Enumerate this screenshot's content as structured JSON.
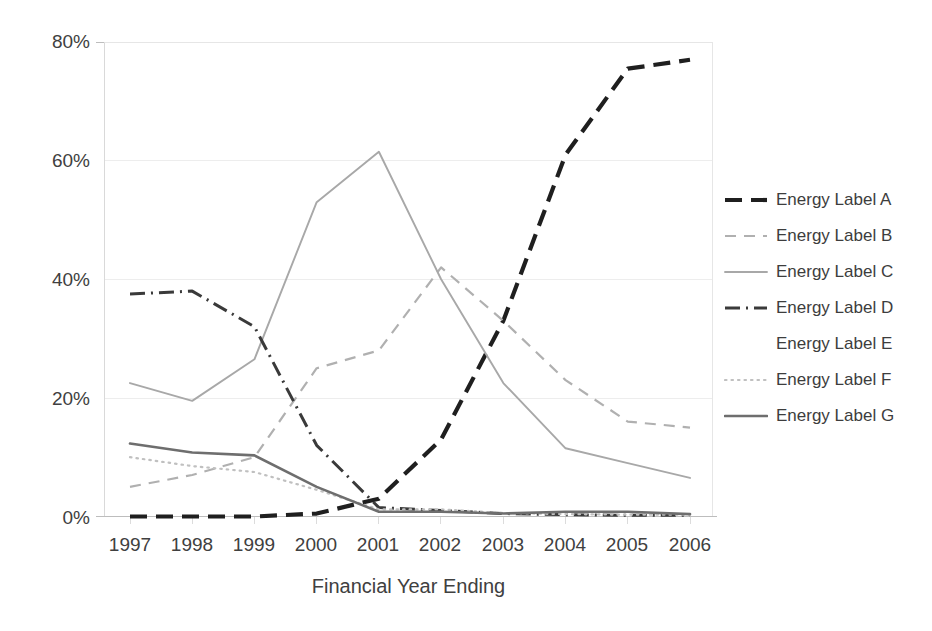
{
  "chart_data": {
    "type": "line",
    "title": "",
    "xlabel": "Financial Year Ending",
    "ylabel": "",
    "x": [
      1997,
      1998,
      1999,
      2000,
      2001,
      2002,
      2003,
      2004,
      2005,
      2006
    ],
    "categories": [
      "1997",
      "1998",
      "1999",
      "2000",
      "2001",
      "2002",
      "2003",
      "2004",
      "2005",
      "2006"
    ],
    "ylim": [
      0,
      80
    ],
    "yticks": [
      0,
      20,
      40,
      60,
      80
    ],
    "ytick_labels": [
      "0%",
      "20%",
      "40%",
      "60%",
      "80%"
    ],
    "grid": true,
    "legend_position": "right",
    "series": [
      {
        "name": "Energy Label A",
        "style": "dashed-thick",
        "color": "#1f1f1f",
        "values": [
          0,
          0,
          0,
          0.5,
          3,
          13,
          33,
          61,
          75.5,
          77
        ]
      },
      {
        "name": "Energy Label B",
        "style": "dashed-thin",
        "color": "#b0b0b0",
        "values": [
          5,
          7,
          10,
          25,
          28,
          42,
          33,
          23,
          16,
          15
        ]
      },
      {
        "name": "Energy Label C",
        "style": "solid-thin",
        "color": "#a8a8a8",
        "values": [
          22.5,
          19.5,
          26.5,
          53,
          61.5,
          40,
          22.5,
          11.5,
          9,
          6.5
        ]
      },
      {
        "name": "Energy Label D",
        "style": "dash-dot",
        "color": "#3a3a3a",
        "values": [
          37.5,
          38,
          32,
          12,
          1.5,
          1,
          0.5,
          0.3,
          0.2,
          0.2
        ]
      },
      {
        "name": "Energy Label E",
        "style": "none",
        "color": "#ffffff",
        "values": [
          0,
          0,
          0,
          0,
          0,
          0,
          0,
          0,
          0,
          0
        ]
      },
      {
        "name": "Energy Label F",
        "style": "dotted",
        "color": "#c0c0c0",
        "values": [
          10,
          8.5,
          7.5,
          4.5,
          1.2,
          1.2,
          0.6,
          0.4,
          0.3,
          0.3
        ]
      },
      {
        "name": "Energy Label G",
        "style": "solid-medium",
        "color": "#6e6e6e",
        "values": [
          12.3,
          10.8,
          10.3,
          5,
          0.8,
          0.8,
          0.5,
          0.8,
          0.8,
          0.4
        ]
      }
    ]
  },
  "axis": {
    "y_labels": [
      "80%",
      "60%",
      "40%",
      "20%",
      "0%"
    ],
    "x_labels": [
      "1997",
      "1998",
      "1999",
      "2000",
      "2001",
      "2002",
      "2003",
      "2004",
      "2005",
      "2006"
    ],
    "x_title": "Financial Year Ending"
  },
  "legend": {
    "items": [
      {
        "label": "Energy Label A"
      },
      {
        "label": "Energy Label B"
      },
      {
        "label": "Energy Label C"
      },
      {
        "label": "Energy Label D"
      },
      {
        "label": "Energy Label E"
      },
      {
        "label": "Energy Label F"
      },
      {
        "label": "Energy Label G"
      }
    ]
  }
}
